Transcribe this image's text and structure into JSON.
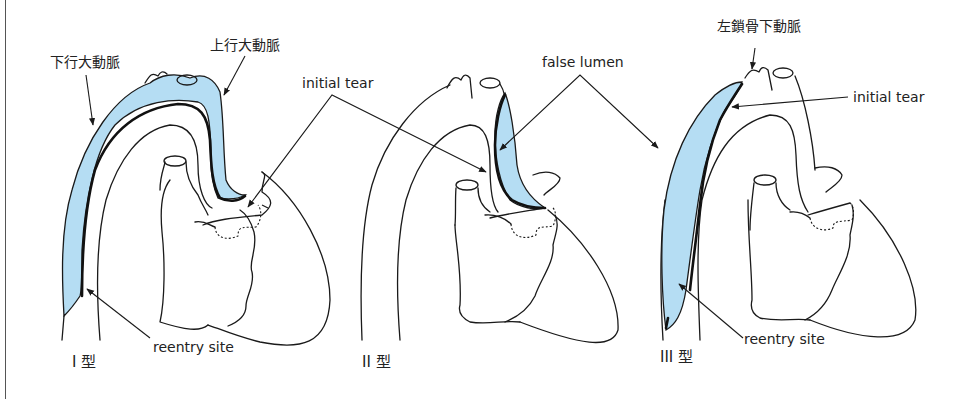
{
  "figure": {
    "colors": {
      "false_lumen": "#b5ddf3",
      "line": "#1a1a1a",
      "background": "#ffffff"
    },
    "panels": [
      {
        "type_label": "I 型",
        "labels": {
          "descending_aorta": "下行大動脈",
          "ascending_aorta": "上行大動脈",
          "initial_tear": "initial tear",
          "reentry_site": "reentry site"
        }
      },
      {
        "type_label": "II 型",
        "labels": {
          "false_lumen": "false lumen"
        }
      },
      {
        "type_label": "III 型",
        "labels": {
          "left_subclavian_artery": "左鎖骨下動脈",
          "initial_tear": "initial tear",
          "reentry_site": "reentry site"
        }
      }
    ]
  }
}
